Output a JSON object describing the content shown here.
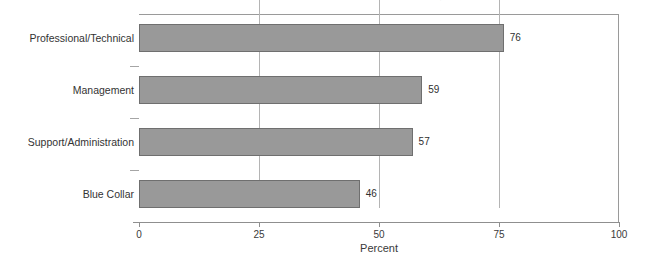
{
  "clipped_title": {
    "note": "partially cropped title line along the very top edge — only descender tips visible, illegible",
    "ghost": "........ ...... .... ........ ...,"
  },
  "chart_data": {
    "type": "bar",
    "orientation": "horizontal",
    "title": "",
    "xlabel": "Percent",
    "ylabel": "",
    "categories": [
      "Professional/Technical",
      "Management",
      "Support/Administration",
      "Blue Collar"
    ],
    "values": [
      76,
      59,
      57,
      46
    ],
    "value_labels": [
      "76",
      "59",
      "57",
      "46"
    ],
    "xlim": [
      0,
      100
    ],
    "xticks": [
      0,
      25,
      50,
      75,
      100
    ],
    "xtick_labels": [
      "0",
      "25",
      "50",
      "75",
      "100"
    ],
    "grid": "vertical",
    "legend": "none",
    "colors": {
      "bar_fill": "#999999",
      "bar_border": "#6f6f6f",
      "gridline": "#b4b4b4",
      "axis": "#8f8f8f",
      "text": "#333333",
      "background": "#ffffff"
    }
  }
}
